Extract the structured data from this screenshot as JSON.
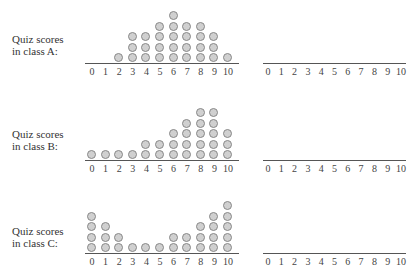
{
  "chart_data": [
    {
      "type": "dot",
      "title": "Quiz scores in class A:",
      "categories": [
        0,
        1,
        2,
        3,
        4,
        5,
        6,
        7,
        8,
        9,
        10
      ],
      "values": [
        0,
        0,
        1,
        3,
        3,
        4,
        5,
        4,
        4,
        3,
        1
      ]
    },
    {
      "type": "dot",
      "title": "Quiz scores in class B:",
      "categories": [
        0,
        1,
        2,
        3,
        4,
        5,
        6,
        7,
        8,
        9,
        10
      ],
      "values": [
        1,
        1,
        1,
        1,
        2,
        2,
        3,
        4,
        5,
        5,
        3
      ]
    },
    {
      "type": "dot",
      "title": "Quiz scores in class C:",
      "categories": [
        0,
        1,
        2,
        3,
        4,
        5,
        6,
        7,
        8,
        9,
        10
      ],
      "values": [
        4,
        3,
        2,
        1,
        1,
        1,
        2,
        2,
        3,
        4,
        5
      ]
    }
  ],
  "rows": [
    {
      "label_line1": "Quiz scores",
      "label_line2": "in class A:"
    },
    {
      "label_line1": "Quiz scores",
      "label_line2": "in class B:"
    },
    {
      "label_line1": "Quiz scores",
      "label_line2": "in class C:"
    }
  ],
  "ticks": [
    "0",
    "1",
    "2",
    "3",
    "4",
    "5",
    "6",
    "7",
    "8",
    "9",
    "10"
  ]
}
